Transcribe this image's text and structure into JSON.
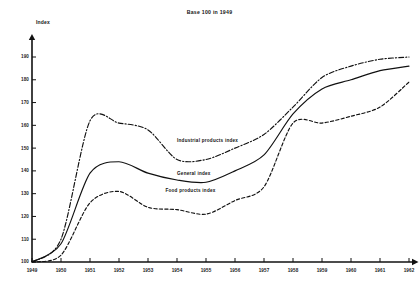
{
  "chart_data": {
    "type": "line",
    "title": "Base 100 in 1949",
    "xlabel": "",
    "ylabel": "Index",
    "x": [
      1949,
      1950,
      1951,
      1952,
      1953,
      1954,
      1955,
      1956,
      1957,
      1958,
      1959,
      1960,
      1961,
      1962
    ],
    "xtick_labels": [
      "1949",
      "1950",
      "1951",
      "1952",
      "1953",
      "1954",
      "1955",
      "1956",
      "1957",
      "1958",
      "1959",
      "1960",
      "1961",
      "1962"
    ],
    "ytick_labels": [
      "100",
      "110",
      "120",
      "130",
      "140",
      "150",
      "160",
      "170",
      "180",
      "190"
    ],
    "ytick_values": [
      100,
      110,
      120,
      130,
      140,
      150,
      160,
      170,
      180,
      190
    ],
    "ylim": [
      100,
      193
    ],
    "xlim": [
      1949,
      1962
    ],
    "grid": false,
    "legend_position": "inline-annotations",
    "series": [
      {
        "name": "Industrial products index",
        "style": "dash-dot",
        "color": "#111111",
        "values": [
          100,
          110,
          162,
          161,
          158,
          145,
          145,
          150,
          156,
          168,
          181,
          186,
          189,
          190
        ],
        "label_x": 1954.0,
        "label_y": 153.5
      },
      {
        "name": "General index",
        "style": "solid",
        "color": "#111111",
        "values": [
          100,
          108,
          139,
          144,
          139,
          136,
          135,
          140,
          147,
          165,
          176,
          180,
          184,
          186
        ],
        "label_x": 1954.0,
        "label_y": 139.0
      },
      {
        "name": "Food products index",
        "style": "dashed",
        "color": "#111111",
        "values": [
          100,
          103,
          126,
          131,
          124,
          123,
          121,
          127,
          133,
          161,
          161,
          164,
          168,
          179
        ],
        "label_x": 1953.6,
        "label_y": 131.5
      }
    ]
  },
  "axes": {
    "y_axis_title": "Index",
    "axis_color": "#111111"
  }
}
